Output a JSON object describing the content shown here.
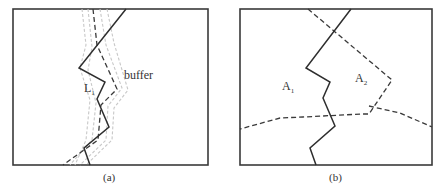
{
  "figure": {
    "panel_a": {
      "caption": "(a)",
      "line_label": "L",
      "line_label_sub": "1",
      "buffer_label": "buffer"
    },
    "panel_b": {
      "caption": "(b)",
      "area1_label": "A",
      "area1_sub": "1",
      "area2_label": "A",
      "area2_sub": "2"
    }
  },
  "colors": {
    "line": "#2e2e2e",
    "buffer": "#c8c8c8",
    "background": "#ffffff"
  }
}
